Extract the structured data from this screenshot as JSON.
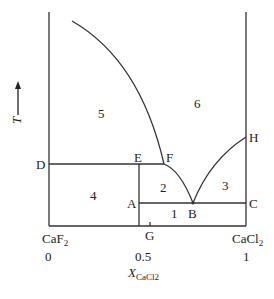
{
  "diagram": {
    "type": "phase-diagram",
    "system": "CaF2-CaCl2",
    "y_axis": {
      "label": "T",
      "arrow": "up"
    },
    "x_axis": {
      "label_main": "X",
      "label_sub": "CaCl2",
      "left_component": {
        "main": "CaF",
        "sub": "2"
      },
      "right_component": {
        "main": "CaCl",
        "sub": "2"
      },
      "ticks": [
        "0",
        "0.5",
        "1"
      ]
    },
    "points": {
      "A": "A",
      "B": "B",
      "C": "C",
      "D": "D",
      "E": "E",
      "F": "F",
      "G": "G",
      "H": "H"
    },
    "regions": {
      "r1": "1",
      "r2": "2",
      "r3": "3",
      "r4": "4",
      "r5": "5",
      "r6": "6"
    },
    "colors": {
      "line": "#333333",
      "background": "#ffffff"
    }
  }
}
